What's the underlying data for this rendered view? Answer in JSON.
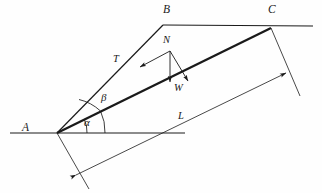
{
  "figure": {
    "type": "free-body-diagram-inclined-plane",
    "background_color": "#fefefe",
    "stroke_color": "#1a1a1a",
    "points": {
      "A": {
        "label": "A",
        "x": 57,
        "y": 133,
        "label_x": 22,
        "label_y": 122
      },
      "B": {
        "label": "B",
        "x": 163,
        "y": 25,
        "label_x": 163,
        "label_y": 5
      },
      "C": {
        "label": "C",
        "x": 271,
        "y": 28,
        "label_x": 268,
        "label_y": 5
      },
      "N_origin": {
        "x": 170,
        "y": 51
      }
    },
    "vectors": [
      {
        "name": "T",
        "label": "T",
        "label_x": 113,
        "label_y": 54,
        "desc": "tension-along-incline-AB",
        "from_x": 170,
        "from_y": 51,
        "to_x": 138,
        "to_y": 68
      },
      {
        "name": "N",
        "label": "N",
        "label_x": 163,
        "label_y": 36,
        "desc": "normal-force-label-above-origin"
      },
      {
        "name": "W",
        "label": "W",
        "label_x": 174,
        "label_y": 84,
        "desc": "weight-vertical-down",
        "from_x": 170,
        "from_y": 51,
        "to_x": 170,
        "to_y": 83
      },
      {
        "name": "Nperp",
        "label": "",
        "desc": "normal-perpendicular-to-incline",
        "from_x": 170,
        "from_y": 51,
        "to_x": 189,
        "to_y": 82
      }
    ],
    "angles": [
      {
        "name": "alpha",
        "label": "α",
        "label_x": 84,
        "label_y": 118,
        "desc": "incline-angle-between-horizontal-and-AC",
        "arc_radius": 30
      },
      {
        "name": "beta",
        "label": "β",
        "label_x": 101,
        "label_y": 93,
        "desc": "angle-between-AC-and-AB",
        "arc_radius": 48
      }
    ],
    "dimensions": [
      {
        "name": "L",
        "label": "L",
        "label_x": 178,
        "label_y": 112,
        "desc": "length-of-incline-A-to-C"
      }
    ],
    "lines": {
      "horizontal_lower": {
        "x1": 10,
        "y1": 133,
        "x2": 185,
        "y2": 133,
        "desc": "ground-reference-line-through-A"
      },
      "horizontal_upper": {
        "x1": 163,
        "y1": 25,
        "x2": 313,
        "y2": 26,
        "desc": "top-reference-line-through-B-and-C"
      },
      "incline_AC": {
        "x1": 57,
        "y1": 133,
        "x2": 271,
        "y2": 28,
        "desc": "incline-surface-bold"
      },
      "line_AB": {
        "x1": 57,
        "y1": 133,
        "x2": 163,
        "y2": 25,
        "desc": "rope-line-A-to-B"
      },
      "dimension_L": {
        "x1": 75,
        "y1": 176,
        "x2": 287,
        "y2": 72,
        "desc": "dimension-line-for-L"
      },
      "ext_A": {
        "x1": 57,
        "y1": 133,
        "x2": 89,
        "y2": 189,
        "desc": "extension-line-from-A"
      },
      "ext_C": {
        "x1": 271,
        "y1": 28,
        "x2": 300,
        "y2": 96,
        "desc": "extension-line-from-C"
      }
    }
  }
}
